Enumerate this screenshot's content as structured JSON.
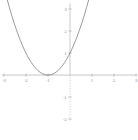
{
  "page": {
    "background": "#ffffff"
  },
  "chart_data": {
    "type": "line",
    "title": "",
    "xlabel": "",
    "ylabel": "",
    "equation": "y = (x+1)^2",
    "grid": false,
    "legend": false,
    "xlim": [
      -3.18,
      3.09
    ],
    "ylim": [
      -2.95,
      3.41
    ],
    "x_axis_extent": [
      -3.1,
      3.05
    ],
    "y_axis_extent": [
      -2.05,
      3.25
    ],
    "axis_style": {
      "negative_y_axis": "dotted",
      "positive_y_axis": "solid"
    },
    "x_ticks": {
      "major": [
        -3,
        -2,
        -1,
        1,
        2,
        3
      ],
      "labels": [
        "-3",
        "-2",
        "-1",
        "1",
        "2",
        "3"
      ],
      "minor_step": 0.2
    },
    "y_ticks": {
      "major": [
        -2,
        -1,
        1,
        2,
        3
      ],
      "labels": [
        "-2",
        "-1",
        "1",
        "2",
        "3"
      ]
    },
    "series": [
      {
        "name": "y=(x+1)^2",
        "points": [
          [
            -2.85,
            3.42
          ],
          [
            -2.75,
            3.06
          ],
          [
            -2.65,
            2.72
          ],
          [
            -2.55,
            2.4
          ],
          [
            -2.45,
            2.1
          ],
          [
            -2.35,
            1.82
          ],
          [
            -2.25,
            1.56
          ],
          [
            -2.15,
            1.32
          ],
          [
            -2.05,
            1.1
          ],
          [
            -1.95,
            0.9
          ],
          [
            -1.85,
            0.72
          ],
          [
            -1.75,
            0.56
          ],
          [
            -1.65,
            0.42
          ],
          [
            -1.55,
            0.3
          ],
          [
            -1.45,
            0.2
          ],
          [
            -1.35,
            0.12
          ],
          [
            -1.25,
            0.06
          ],
          [
            -1.15,
            0.02
          ],
          [
            -1.05,
            0.0
          ],
          [
            -0.95,
            0.0
          ],
          [
            -0.85,
            0.02
          ],
          [
            -0.75,
            0.06
          ],
          [
            -0.65,
            0.12
          ],
          [
            -0.55,
            0.2
          ],
          [
            -0.45,
            0.3
          ],
          [
            -0.35,
            0.42
          ],
          [
            -0.25,
            0.56
          ],
          [
            -0.15,
            0.72
          ],
          [
            -0.05,
            0.9
          ],
          [
            0.05,
            1.1
          ],
          [
            0.15,
            1.32
          ],
          [
            0.25,
            1.56
          ],
          [
            0.35,
            1.82
          ],
          [
            0.45,
            2.1
          ],
          [
            0.55,
            2.4
          ],
          [
            0.65,
            2.72
          ],
          [
            0.75,
            3.06
          ],
          [
            0.85,
            3.42
          ]
        ]
      }
    ],
    "colors": {
      "curve": "#808080",
      "axis": "#b3b3b3",
      "major_tick": "#a6a6a6",
      "minor_tick": "#d4d4d4",
      "tick_label": "#999999",
      "background": "#ffffff"
    }
  }
}
